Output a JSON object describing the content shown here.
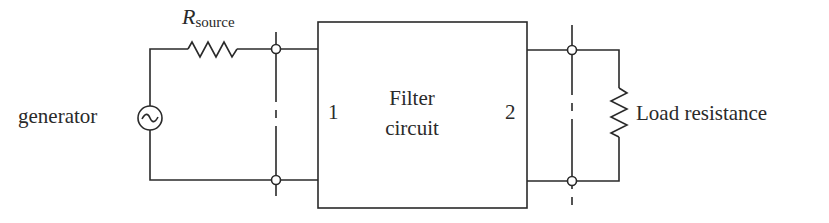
{
  "diagram": {
    "type": "circuit",
    "source": {
      "label": "generator",
      "resistor_symbol": "R",
      "resistor_subscript": "source"
    },
    "filter": {
      "title_line1": "Filter",
      "title_line2": "circuit",
      "port_in": "1",
      "port_out": "2"
    },
    "load": {
      "label": "Load resistance"
    },
    "colors": {
      "line": "#2a2a2a",
      "background": "#ffffff"
    },
    "icons": {
      "generator": "ac-source-icon",
      "resistor": "resistor-icon",
      "terminal": "terminal-node-icon"
    }
  }
}
